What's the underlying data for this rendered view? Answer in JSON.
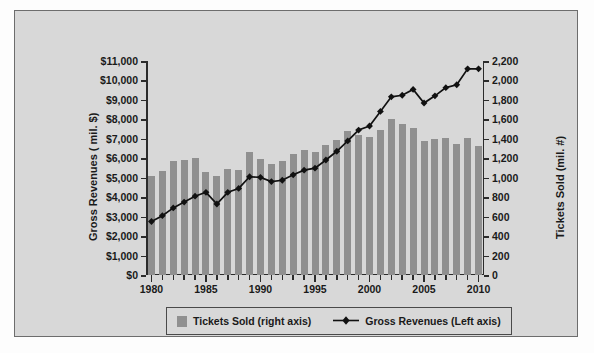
{
  "chart_data": {
    "type": "bar",
    "title": "",
    "xlabel": "",
    "ylabel": "Gross Revenues ( mil. $)",
    "y2label": "Tickets Sold (mil. #)",
    "grid": false,
    "legend_position": "bottom",
    "ylim": [
      0,
      11000
    ],
    "y2lim": [
      0,
      2200
    ],
    "xlim": [
      1980,
      2010
    ],
    "ytick_labels": [
      "$0",
      "$1,000",
      "$2,000",
      "$3,000",
      "$4,000",
      "$5,000",
      "$6,000",
      "$7,000",
      "$8,000",
      "$9,000",
      "$10,000",
      "$11,000"
    ],
    "ytick_values": [
      0,
      1000,
      2000,
      3000,
      4000,
      5000,
      6000,
      7000,
      8000,
      9000,
      10000,
      11000
    ],
    "y2tick_labels": [
      "0",
      "200",
      "400",
      "600",
      "800",
      "1,000",
      "1,200",
      "1,400",
      "1,600",
      "1,800",
      "2,000",
      "2,200"
    ],
    "y2tick_values": [
      0,
      200,
      400,
      600,
      800,
      1000,
      1200,
      1400,
      1600,
      1800,
      2000,
      2200
    ],
    "xtick_labels": [
      "1980",
      "1985",
      "1990",
      "1995",
      "2000",
      "2005",
      "2010"
    ],
    "xtick_values": [
      1980,
      1985,
      1990,
      1995,
      2000,
      2005,
      2010
    ],
    "categories": [
      1980,
      1981,
      1982,
      1983,
      1984,
      1985,
      1986,
      1987,
      1988,
      1989,
      1990,
      1991,
      1992,
      1993,
      1994,
      1995,
      1996,
      1997,
      1998,
      1999,
      2000,
      2001,
      2002,
      2003,
      2004,
      2005,
      2006,
      2007,
      2008,
      2009,
      2010
    ],
    "series": [
      {
        "name": "Tickets Sold (right axis)",
        "axis": "right",
        "kind": "bar",
        "color": "#909090",
        "values": [
          1020,
          1070,
          1170,
          1180,
          1200,
          1060,
          1020,
          1090,
          1080,
          1260,
          1190,
          1140,
          1170,
          1240,
          1290,
          1260,
          1340,
          1390,
          1480,
          1440,
          1420,
          1490,
          1600,
          1550,
          1510,
          1380,
          1400,
          1410,
          1350,
          1410,
          1330
        ]
      },
      {
        "name": "Gross Revenues (Left axis)",
        "axis": "left",
        "kind": "line",
        "color": "#111111",
        "marker": "diamond",
        "values": [
          2750,
          3050,
          3450,
          3750,
          4050,
          4250,
          3650,
          4250,
          4450,
          5050,
          5020,
          4800,
          4870,
          5150,
          5390,
          5490,
          5910,
          6360,
          6890,
          7450,
          7660,
          8410,
          9160,
          9240,
          9540,
          8840,
          9210,
          9630,
          9780,
          10600,
          10600
        ]
      }
    ]
  },
  "legend": {
    "items": [
      {
        "label": "Tickets Sold (right axis)",
        "marker": "swatch"
      },
      {
        "label": "Gross Revenues (Left axis)",
        "marker": "line-diamond"
      }
    ]
  }
}
